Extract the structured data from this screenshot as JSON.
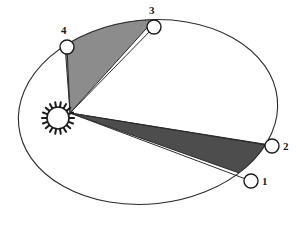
{
  "figure": {
    "background_color": "#ffffff",
    "width": 300,
    "height": 229
  },
  "orbit": {
    "name": "elliptical-orbit",
    "shape": "ellipse",
    "center_x": 148,
    "center_y": 112,
    "radius_x": 130,
    "radius_y": 92,
    "rotation_deg": -6,
    "stroke_color": "#2b2b2b",
    "stroke_width": 1
  },
  "sun": {
    "label": "sun",
    "center_x": 58,
    "center_y": 118,
    "core_radius": 11,
    "ray_count": 18,
    "ray_length": 5,
    "fill_color": "#ffffff",
    "stroke_color": "#1a1a1a"
  },
  "focus_vertex": {
    "x": 70,
    "y": 113
  },
  "points": [
    {
      "id": "point-1",
      "label": "1",
      "x": 251,
      "y": 181,
      "radius": 7,
      "label_x": 262,
      "label_y": 176
    },
    {
      "id": "point-2",
      "label": "2",
      "x": 272,
      "y": 146,
      "radius": 7,
      "label_x": 283,
      "label_y": 141
    },
    {
      "id": "point-3",
      "label": "3",
      "x": 154,
      "y": 27,
      "radius": 7,
      "label_x": 149,
      "label_y": 5
    },
    {
      "id": "point-4",
      "label": "4",
      "x": 67,
      "y": 47,
      "radius": 7,
      "label_x": 61,
      "label_y": 25
    }
  ],
  "sectors": [
    {
      "id": "sector-1-2",
      "name": "swept-area-dark",
      "from_point": "1",
      "to_point": "2",
      "fill_color": "#4d4d4d",
      "stroke_color": "#2b2b2b",
      "description": "Dark shaded area swept between position 1 and position 2"
    },
    {
      "id": "sector-4-3",
      "name": "swept-area-light",
      "from_point": "4",
      "to_point": "3",
      "fill_color": "#8c8c8c",
      "stroke_color": "#2b2b2b",
      "description": "Light shaded area swept between position 4 and position 3"
    }
  ]
}
